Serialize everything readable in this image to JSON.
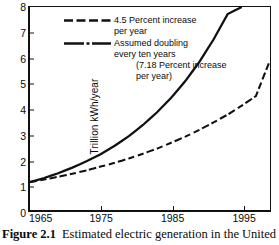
{
  "figure": {
    "caption_label": "Figure 2.1",
    "caption_text": "Estimated electric generation in the United"
  },
  "chart_data": {
    "type": "line",
    "title": "",
    "subtitle": "",
    "xlabel": "",
    "ylabel": "Trillion kWh/year",
    "xlim": [
      1965,
      1999
    ],
    "ylim": [
      0,
      8
    ],
    "grid": false,
    "legend_position": "top-left",
    "xticks": [
      1965,
      1975,
      1985,
      1995
    ],
    "xtick_labels": [
      "1965",
      "1975",
      "1985",
      "1995"
    ],
    "yticks": [
      0,
      1,
      2,
      3,
      4,
      5,
      6,
      7,
      8
    ],
    "ytick_labels": [
      "0",
      "1",
      "2",
      "3",
      "4",
      "5",
      "6",
      "7",
      "8"
    ],
    "x": [
      1965,
      1967,
      1969,
      1971,
      1973,
      1975,
      1977,
      1979,
      1981,
      1983,
      1985,
      1987,
      1989,
      1991,
      1993,
      1995,
      1997,
      1999
    ],
    "series": [
      {
        "name": "4.5 Percent increase per year",
        "style": "dashed",
        "color": "#111111",
        "growth_rate_percent": 4.5,
        "values": [
          1.1,
          1.2,
          1.31,
          1.43,
          1.56,
          1.71,
          1.86,
          2.03,
          2.22,
          2.42,
          2.65,
          2.89,
          3.16,
          3.45,
          3.76,
          4.11,
          4.49,
          5.9
        ]
      },
      {
        "name": "Assumed doubling every ten years (7.18 Percent increase per year)",
        "style": "dash-dot",
        "color": "#111111",
        "growth_rate_percent": 7.18,
        "values": [
          1.1,
          1.26,
          1.45,
          1.67,
          1.92,
          2.2,
          2.53,
          2.91,
          3.35,
          3.85,
          4.42,
          5.08,
          5.84,
          6.72,
          7.72,
          8.0,
          8.0,
          8.0
        ]
      }
    ],
    "annotations": []
  },
  "legend": {
    "entries": [
      {
        "swatch": "dashed-line",
        "line1": "4.5 Percent increase",
        "line2": "per year",
        "line3": "",
        "line4": ""
      },
      {
        "swatch": "dash-dot-line",
        "line1": "Assumed doubling",
        "line2": "every ten years",
        "line3": "(7.18 Percent increase",
        "line4": "per year)"
      }
    ]
  },
  "axes": {
    "y_label": "Trillion kWh/year",
    "y_ticks": [
      "8",
      "7",
      "6",
      "5",
      "4",
      "3",
      "2",
      "1",
      "0"
    ],
    "x_ticks": [
      "1965",
      "1975",
      "1985",
      "1995"
    ]
  }
}
